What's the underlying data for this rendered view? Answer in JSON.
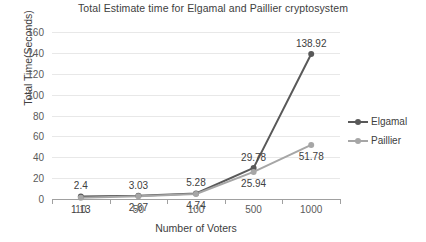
{
  "chart_data": {
    "type": "line",
    "title": "Total Estimate time for Elgamal and Paillier cryptosystem",
    "xlabel": "Number of Voters",
    "ylabel": "Total Time(Seconds)",
    "categories": [
      "10",
      "50",
      "100",
      "500",
      "1000"
    ],
    "series": [
      {
        "name": "Elgamal",
        "color": "#595959",
        "values": [
          2.4,
          3.03,
          5.28,
          29.78,
          138.92
        ],
        "labels": [
          "2.4",
          "3.03",
          "5.28",
          "29.78",
          "138.92"
        ]
      },
      {
        "name": "Paillier",
        "color": "#a6a6a6",
        "values": [
          1.13,
          2.67,
          4.74,
          25.94,
          51.78
        ],
        "labels": [
          "1.13",
          "2.67",
          "4.74",
          "25.94",
          "51.78"
        ]
      }
    ],
    "ylim": [
      0,
      160
    ],
    "yticks": [
      0,
      20,
      40,
      60,
      80,
      100,
      120,
      140,
      160
    ],
    "ytick_labels": [
      "0",
      "20",
      "40",
      "60",
      "80",
      "100",
      "120",
      "140",
      "160"
    ],
    "grid": true,
    "legend_position": "right"
  },
  "legend": {
    "items": [
      {
        "label": "Elgamal",
        "color": "#595959"
      },
      {
        "label": "Paillier",
        "color": "#a6a6a6"
      }
    ]
  }
}
